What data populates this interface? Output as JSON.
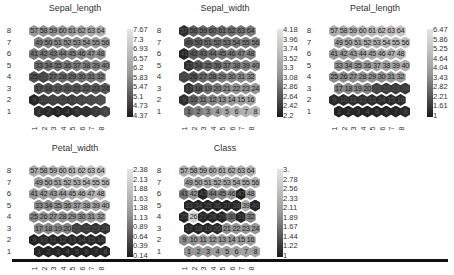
{
  "chart_data": [
    {
      "type": "heatmap",
      "title": "Sepal_length",
      "subtype": "hexagonal SOM component plane",
      "grid": {
        "rows": 8,
        "cols": 8
      },
      "row_labels": [
        "8",
        "7",
        "6",
        "5",
        "4",
        "3",
        "2",
        "1"
      ],
      "col_labels": [
        "1",
        "2",
        "3",
        "4",
        "5",
        "6",
        "7",
        "8"
      ],
      "colorbar_ticks": [
        "7.67",
        "7.3",
        "6.93",
        "6.57",
        "6.2",
        "5.83",
        "5.47",
        "5.1",
        "4.73",
        "4.37"
      ],
      "range": [
        4.37,
        7.67
      ],
      "levels": [
        [
          0.62,
          0.6,
          0.6,
          0.62,
          0.64,
          0.66,
          0.7,
          0.72
        ],
        [
          0.5,
          0.52,
          0.55,
          0.56,
          0.58,
          0.6,
          0.62,
          0.62
        ],
        [
          0.45,
          0.47,
          0.48,
          0.5,
          0.52,
          0.54,
          0.56,
          0.58
        ],
        [
          0.4,
          0.42,
          0.44,
          0.46,
          0.48,
          0.5,
          0.52,
          0.54
        ],
        [
          0.28,
          0.2,
          0.36,
          0.38,
          0.38,
          0.42,
          0.44,
          0.46
        ],
        [
          0.25,
          0.27,
          0.3,
          0.3,
          0.28,
          0.32,
          0.3,
          0.3
        ],
        [
          0.05,
          0.14,
          0.18,
          0.18,
          0.16,
          0.2,
          0.22,
          0.24
        ],
        [
          0.1,
          0.08,
          0.05,
          0.06,
          0.1,
          0.12,
          0.16,
          0.2
        ]
      ]
    },
    {
      "type": "heatmap",
      "title": "Sepal_width",
      "subtype": "hexagonal SOM component plane",
      "grid": {
        "rows": 8,
        "cols": 8
      },
      "row_labels": [
        "8",
        "7",
        "6",
        "5",
        "4",
        "3",
        "2",
        "1"
      ],
      "col_labels": [
        "1",
        "2",
        "3",
        "4",
        "5",
        "6",
        "7",
        "8"
      ],
      "colorbar_ticks": [
        "4.18",
        "3.96",
        "3.74",
        "3.52",
        "3.3",
        "3.08",
        "2.86",
        "2.64",
        "2.42",
        "2.2"
      ],
      "range": [
        2.2,
        4.18
      ],
      "levels": [
        [
          0.1,
          0.35,
          0.38,
          0.38,
          0.4,
          0.42,
          0.45,
          0.48
        ],
        [
          0.3,
          0.35,
          0.4,
          0.42,
          0.44,
          0.46,
          0.48,
          0.5
        ],
        [
          0.05,
          0.32,
          0.38,
          0.42,
          0.46,
          0.48,
          0.5,
          0.52
        ],
        [
          0.1,
          0.3,
          0.38,
          0.4,
          0.46,
          0.5,
          0.52,
          0.55
        ],
        [
          0.2,
          0.28,
          0.38,
          0.42,
          0.48,
          0.52,
          0.55,
          0.58
        ],
        [
          0.12,
          0.3,
          0.42,
          0.48,
          0.54,
          0.58,
          0.6,
          0.62
        ],
        [
          0.1,
          0.36,
          0.46,
          0.52,
          0.58,
          0.62,
          0.66,
          0.68
        ],
        [
          0.42,
          0.5,
          0.58,
          0.64,
          0.7,
          0.72,
          0.74,
          0.76
        ]
      ]
    },
    {
      "type": "heatmap",
      "title": "Petal_length",
      "subtype": "hexagonal SOM component plane",
      "grid": {
        "rows": 8,
        "cols": 8
      },
      "row_labels": [
        "8",
        "7",
        "6",
        "5",
        "4",
        "3",
        "2",
        "1"
      ],
      "col_labels": [
        "1",
        "2",
        "3",
        "4",
        "5",
        "6",
        "7",
        "8"
      ],
      "colorbar_ticks": [
        "6.47",
        "5.86",
        "5.25",
        "4.64",
        "4.04",
        "3.43",
        "2.82",
        "2.21",
        "1.61",
        "1"
      ],
      "range": [
        1,
        6.47
      ],
      "levels": [
        [
          0.72,
          0.72,
          0.74,
          0.76,
          0.78,
          0.8,
          0.82,
          0.84
        ],
        [
          0.66,
          0.68,
          0.7,
          0.72,
          0.74,
          0.76,
          0.78,
          0.8
        ],
        [
          0.62,
          0.64,
          0.66,
          0.68,
          0.7,
          0.72,
          0.74,
          0.76
        ],
        [
          0.6,
          0.6,
          0.62,
          0.64,
          0.66,
          0.68,
          0.7,
          0.72
        ],
        [
          0.56,
          0.56,
          0.58,
          0.6,
          0.6,
          0.58,
          0.62,
          0.64
        ],
        [
          0.52,
          0.54,
          0.54,
          0.5,
          0.2,
          0.16,
          0.14,
          0.14
        ],
        [
          0.08,
          0.08,
          0.1,
          0.1,
          0.1,
          0.08,
          0.08,
          0.08
        ],
        [
          0.05,
          0.05,
          0.05,
          0.05,
          0.05,
          0.05,
          0.06,
          0.08
        ]
      ]
    },
    {
      "type": "heatmap",
      "title": "Petal_width",
      "subtype": "hexagonal SOM component plane",
      "grid": {
        "rows": 8,
        "cols": 8
      },
      "row_labels": [
        "8",
        "7",
        "6",
        "5",
        "4",
        "3",
        "2",
        "1"
      ],
      "col_labels": [
        "1",
        "2",
        "3",
        "4",
        "5",
        "6",
        "7",
        "8"
      ],
      "colorbar_ticks": [
        "2.38",
        "2.13",
        "1.88",
        "1.63",
        "1.38",
        "1.13",
        "0.89",
        "0.64",
        "0.39",
        "0.14"
      ],
      "range": [
        0.14,
        2.38
      ],
      "levels": [
        [
          0.72,
          0.72,
          0.74,
          0.76,
          0.78,
          0.8,
          0.82,
          0.84
        ],
        [
          0.66,
          0.68,
          0.7,
          0.72,
          0.74,
          0.76,
          0.78,
          0.8
        ],
        [
          0.62,
          0.64,
          0.66,
          0.66,
          0.7,
          0.72,
          0.74,
          0.76
        ],
        [
          0.58,
          0.56,
          0.6,
          0.62,
          0.64,
          0.66,
          0.68,
          0.7
        ],
        [
          0.56,
          0.6,
          0.58,
          0.6,
          0.6,
          0.58,
          0.62,
          0.64
        ],
        [
          0.52,
          0.54,
          0.54,
          0.5,
          0.18,
          0.14,
          0.12,
          0.12
        ],
        [
          0.05,
          0.08,
          0.06,
          0.06,
          0.06,
          0.06,
          0.06,
          0.06
        ],
        [
          0.06,
          0.05,
          0.05,
          0.05,
          0.05,
          0.05,
          0.06,
          0.06
        ]
      ]
    },
    {
      "type": "heatmap",
      "title": "Class",
      "subtype": "hexagonal SOM component plane",
      "grid": {
        "rows": 8,
        "cols": 8
      },
      "row_labels": [
        "8",
        "7",
        "6",
        "5",
        "4",
        "3",
        "2",
        "1"
      ],
      "col_labels": [
        "1",
        "2",
        "3",
        "4",
        "5",
        "6",
        "7",
        "8"
      ],
      "colorbar_ticks": [
        "3.",
        "2.78",
        "2.56",
        "2.33",
        "2.11",
        "1.89",
        "1.67",
        "1.44",
        "1.22",
        "1"
      ],
      "range": [
        1,
        3
      ],
      "levels": [
        [
          0.72,
          0.72,
          0.72,
          0.74,
          0.74,
          0.74,
          0.74,
          0.74
        ],
        [
          0.66,
          0.68,
          0.7,
          0.7,
          0.7,
          0.7,
          0.72,
          0.72
        ],
        [
          0.45,
          0.62,
          0.05,
          0.5,
          0.52,
          0.62,
          0.05,
          0.66
        ],
        [
          0.05,
          0.05,
          0.05,
          0.05,
          0.05,
          0.05,
          0.7,
          0.05
        ],
        [
          0.05,
          0.9,
          0.05,
          0.05,
          0.05,
          0.4,
          0.05,
          0.5
        ],
        [
          0.05,
          0.05,
          0.05,
          0.08,
          0.58,
          0.6,
          0.62,
          0.62
        ],
        [
          0.55,
          0.58,
          0.6,
          0.62,
          0.62,
          0.62,
          0.64,
          0.64
        ],
        [
          0.6,
          0.62,
          0.62,
          0.64,
          0.64,
          0.66,
          0.66,
          0.66
        ]
      ]
    }
  ],
  "panels": [
    {
      "title": "Sepal_length"
    },
    {
      "title": "Sepal_width"
    },
    {
      "title": "Petal_length"
    },
    {
      "title": "Petal_width"
    },
    {
      "title": "Class"
    }
  ],
  "cell_numbers": {
    "Sepal_length": [
      [
        "57",
        "58",
        "59",
        "60",
        "61",
        "62",
        "63",
        "64"
      ],
      [
        "49",
        "50",
        "51",
        "52",
        "53",
        "54",
        "55",
        "56"
      ],
      [
        "41",
        "42",
        "43",
        "44",
        "45",
        "46",
        "47",
        "48"
      ],
      [
        "33",
        "34",
        "35",
        "36",
        "37",
        "38",
        "39",
        "40"
      ],
      [
        "25",
        "26",
        "27",
        "28",
        "29",
        "30",
        "31",
        "32"
      ],
      [
        "17",
        "18",
        "19",
        "20",
        "21",
        "22",
        "23",
        "24"
      ],
      [
        "9",
        "10",
        "11",
        "12",
        "13",
        "14",
        "15",
        "16"
      ],
      [
        "1",
        "2",
        "3",
        "4",
        "5",
        "",
        "7",
        "8"
      ]
    ],
    "Sepal_width": [
      [
        "57",
        "58",
        "59",
        "60",
        "61",
        "62",
        "63",
        "64"
      ],
      [
        "49",
        "50",
        "51",
        "52",
        "53",
        "54",
        "55",
        "56"
      ],
      [
        "41",
        "42",
        "43",
        "44",
        "45",
        "46",
        "47",
        "48"
      ],
      [
        "33",
        "34",
        "35",
        "36",
        "37",
        "38",
        "39",
        "40"
      ],
      [
        "25",
        "26",
        "27",
        "28",
        "29",
        "30",
        "31",
        "32"
      ],
      [
        "17",
        "18",
        "19",
        "20",
        "21",
        "22",
        "23",
        "24"
      ],
      [
        "9",
        "10",
        "11",
        "12",
        "13",
        "14",
        "15",
        "16"
      ],
      [
        "1",
        "2",
        "3",
        "4",
        "5",
        "6",
        "7",
        "8"
      ]
    ],
    "Petal_length": [
      [
        "57",
        "58",
        "59",
        "60",
        "61",
        "62",
        "63",
        "64"
      ],
      [
        "49",
        "50",
        "51",
        "52",
        "53",
        "54",
        "55",
        "56"
      ],
      [
        "41",
        "42",
        "43",
        "44",
        "45",
        "46",
        "47",
        "48"
      ],
      [
        "33",
        "34",
        "35",
        "36",
        "37",
        "38",
        "39",
        "40"
      ],
      [
        "25",
        "26",
        "27",
        "28",
        "29",
        "30",
        "31",
        "32"
      ],
      [
        "17",
        "18",
        "19",
        "20",
        "21",
        "22",
        "23",
        "24"
      ],
      [
        "9",
        "10",
        "11",
        "12",
        "13",
        "14",
        "15",
        "16"
      ],
      [
        "1",
        "2",
        "3",
        "4",
        "5",
        "6",
        "7",
        "8"
      ]
    ],
    "Petal_width": [
      [
        "57",
        "58",
        "59",
        "60",
        "61",
        "62",
        "63",
        "64"
      ],
      [
        "49",
        "50",
        "51",
        "52",
        "53",
        "54",
        "55",
        "56"
      ],
      [
        "41",
        "42",
        "43",
        "44",
        "45",
        "46",
        "47",
        "48"
      ],
      [
        "33",
        "34",
        "35",
        "36",
        "37",
        "38",
        "39",
        "40"
      ],
      [
        "25",
        "26",
        "27",
        "28",
        "29",
        "30",
        "31",
        "32"
      ],
      [
        "17",
        "18",
        "19",
        "20",
        "21",
        "22",
        "23",
        "24"
      ],
      [
        "9",
        "10",
        "11",
        "12",
        "13",
        "14",
        "15",
        "16"
      ],
      [
        "1",
        "2",
        "3",
        "4",
        "5",
        "6",
        "7",
        "8"
      ]
    ],
    "Class": [
      [
        "57",
        "58",
        "59",
        "60",
        "61",
        "62",
        "63",
        "64"
      ],
      [
        "49",
        "50",
        "51",
        "52",
        "53",
        "54",
        "55",
        "56"
      ],
      [
        "41",
        "42",
        "43",
        "44",
        "45",
        "46",
        "47",
        "48"
      ],
      [
        "33",
        "34",
        "35",
        "36",
        "37",
        "38",
        "39",
        "40"
      ],
      [
        "25",
        "26",
        "27",
        "28",
        "29",
        "30",
        "31",
        "32"
      ],
      [
        "17",
        "18",
        "19",
        "20",
        "21",
        "22",
        "23",
        "24"
      ],
      [
        "9",
        "10",
        "11",
        "12",
        "13",
        "14",
        "15",
        "16"
      ],
      [
        "1",
        "2",
        "3",
        "4",
        "5",
        "6",
        "7",
        "8"
      ]
    ]
  },
  "colormap": {
    "low": "#1a1a1a",
    "high": "#e6e6e6"
  }
}
